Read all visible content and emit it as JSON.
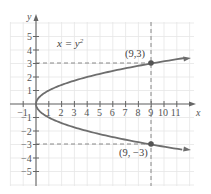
{
  "chart_data": {
    "type": "line",
    "title": "",
    "equation_label": "x = y²",
    "xlabel": "x",
    "ylabel": "y",
    "xlim": [
      -2,
      12
    ],
    "ylim": [
      -6,
      6
    ],
    "grid": true,
    "x_ticks": [
      -1,
      1,
      2,
      3,
      4,
      5,
      6,
      7,
      8,
      9,
      10,
      11
    ],
    "y_ticks": [
      5,
      4,
      3,
      2,
      1,
      -1,
      -2,
      -3,
      -4,
      -5
    ],
    "series": [
      {
        "name": "x = y^2",
        "type": "parametric",
        "points": [
          [
            11,
            3.317
          ],
          [
            9,
            3
          ],
          [
            4,
            2
          ],
          [
            1,
            1
          ],
          [
            0,
            0
          ],
          [
            1,
            -1
          ],
          [
            4,
            -2
          ],
          [
            9,
            -3
          ],
          [
            11,
            -3.317
          ]
        ],
        "arrows_at_ends": true
      }
    ],
    "highlighted_points": [
      {
        "x": 9,
        "y": 3,
        "label": "(9,3)"
      },
      {
        "x": 9,
        "y": -3,
        "label": "(9, −3)"
      }
    ],
    "reference_lines": [
      {
        "orientation": "horizontal",
        "value": 3,
        "style": "dashed"
      },
      {
        "orientation": "horizontal",
        "value": -3,
        "style": "dashed"
      },
      {
        "orientation": "vertical",
        "value": 9,
        "style": "dashed"
      }
    ]
  },
  "labels": {
    "equation": "x = y",
    "equation_exp": "2",
    "x_axis": "x",
    "y_axis": "y",
    "point_upper": "(9,3)",
    "point_lower": "(9, −3)",
    "x_tick_labels": [
      "−1",
      "1",
      "2",
      "3",
      "4",
      "5",
      "6",
      "7",
      "8",
      "9",
      "10",
      "11"
    ],
    "y_tick_labels": [
      "5",
      "4",
      "3",
      "2",
      "1",
      "−1",
      "−2",
      "−3",
      "−4",
      "−5"
    ]
  }
}
